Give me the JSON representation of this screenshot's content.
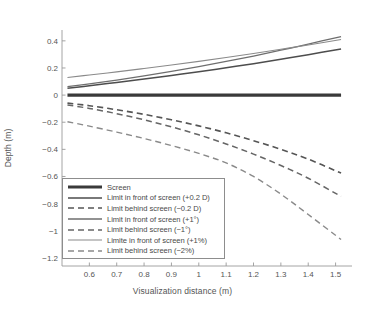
{
  "chart_data": {
    "type": "line",
    "title": "",
    "xlabel": "Visualization distance (m)",
    "ylabel": "Depth (m)",
    "xlim": [
      0.5,
      1.56
    ],
    "ylim": [
      -1.26,
      0.48
    ],
    "xticks": [
      "0.6",
      "0.7",
      "0.8",
      "0.9",
      "1",
      "1.1",
      "1.2",
      "1.3",
      "1.4",
      "1.5"
    ],
    "xtick_values": [
      0.6,
      0.7,
      0.8,
      0.9,
      1.0,
      1.1,
      1.2,
      1.3,
      1.4,
      1.5
    ],
    "yticks": [
      "0.4",
      "0.2",
      "0",
      "-0.2",
      "-0.4",
      "-0.6",
      "-0.8",
      "-1",
      "-1.2"
    ],
    "ytick_values": [
      0.4,
      0.2,
      0,
      -0.2,
      -0.4,
      -0.6,
      -0.8,
      -1.0,
      -1.2
    ],
    "grid": false,
    "legend_position": "lower-left",
    "x": [
      0.52,
      0.6,
      0.7,
      0.8,
      0.9,
      1.0,
      1.1,
      1.2,
      1.3,
      1.4,
      1.52
    ],
    "series": [
      {
        "name": "Screen",
        "style": "solid",
        "width": 3.2,
        "color": "#3a3a3a",
        "values": [
          0,
          0,
          0,
          0,
          0,
          0,
          0,
          0,
          0,
          0,
          0
        ]
      },
      {
        "name": "Limit in front of screen (+0.2 D)",
        "style": "solid",
        "width": 1.5,
        "color": "#4d4d4d",
        "values": [
          0.05,
          0.069,
          0.093,
          0.118,
          0.145,
          0.172,
          0.202,
          0.232,
          0.264,
          0.298,
          0.34
        ]
      },
      {
        "name": "Limit behind screen (−0.2 D)",
        "style": "dashed",
        "width": 1.6,
        "color": "#555555",
        "values": [
          -0.059,
          -0.078,
          -0.108,
          -0.142,
          -0.182,
          -0.227,
          -0.278,
          -0.336,
          -0.4,
          -0.472,
          -0.575
        ]
      },
      {
        "name": "Limit in front of screen (+1°)",
        "style": "solid",
        "width": 1.3,
        "color": "#6e6e6e",
        "values": [
          0.062,
          0.083,
          0.111,
          0.142,
          0.175,
          0.21,
          0.248,
          0.288,
          0.331,
          0.376,
          0.432
        ]
      },
      {
        "name": "Limit behind screen (−1°)",
        "style": "dashed",
        "width": 1.5,
        "color": "#666666",
        "values": [
          -0.073,
          -0.098,
          -0.137,
          -0.182,
          -0.234,
          -0.293,
          -0.36,
          -0.435,
          -0.519,
          -0.613,
          -0.747
        ]
      },
      {
        "name": "Limite in front of screen (+1%)",
        "style": "solid",
        "width": 1.1,
        "color": "#8a8a8a",
        "values": [
          0.13,
          0.148,
          0.171,
          0.196,
          0.222,
          0.249,
          0.277,
          0.307,
          0.338,
          0.37,
          0.41
        ]
      },
      {
        "name": "Limit behind screen (−2%)",
        "style": "dashed",
        "width": 1.4,
        "color": "#8a8a8a",
        "values": [
          -0.196,
          -0.229,
          -0.273,
          -0.32,
          -0.372,
          -0.43,
          -0.5,
          -0.6,
          -0.73,
          -0.88,
          -1.065
        ]
      }
    ]
  },
  "axes": {
    "line_color": "#9a9a9a"
  }
}
